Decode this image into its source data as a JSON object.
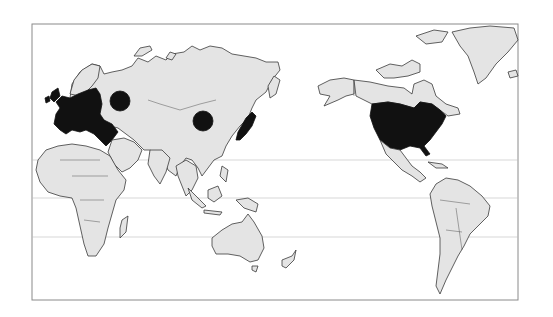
{
  "map": {
    "type": "world-map-pacific-centered",
    "background": "#ffffff",
    "land_color": "#e4e4e4",
    "highlight_color": "#111111",
    "frame": {
      "x": 32,
      "y": 24,
      "width": 486,
      "height": 276
    },
    "gridlines_y": [
      160,
      198,
      237
    ],
    "highlighted_regions": [
      {
        "name": "Western Europe",
        "style": "filled"
      },
      {
        "name": "Japan",
        "style": "filled"
      },
      {
        "name": "United States",
        "style": "filled"
      }
    ],
    "markers": [
      {
        "name": "Russia",
        "shape": "circle",
        "cx": 120,
        "cy": 101,
        "r": 10
      },
      {
        "name": "China",
        "shape": "circle",
        "cx": 203,
        "cy": 121,
        "r": 10
      }
    ]
  }
}
